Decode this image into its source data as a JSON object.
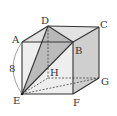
{
  "diagram": {
    "type": "cube",
    "vertices": {
      "A": {
        "label": "A",
        "x": 22,
        "y": 42
      },
      "B": {
        "label": "B",
        "x": 73,
        "y": 42
      },
      "C": {
        "label": "C",
        "x": 99,
        "y": 27
      },
      "D": {
        "label": "D",
        "x": 48,
        "y": 26
      },
      "E": {
        "label": "E",
        "x": 22,
        "y": 94
      },
      "F": {
        "label": "F",
        "x": 73,
        "y": 94
      },
      "G": {
        "label": "G",
        "x": 99,
        "y": 78
      },
      "H": {
        "label": "H",
        "x": 48,
        "y": 78
      }
    },
    "edge_length_label": "8",
    "shaded_triangle": [
      "D",
      "B",
      "E"
    ],
    "colors": {
      "edge": "#333333",
      "face_shade": "#c8c8c8",
      "triangle_shade": "#a8a8a8"
    }
  }
}
